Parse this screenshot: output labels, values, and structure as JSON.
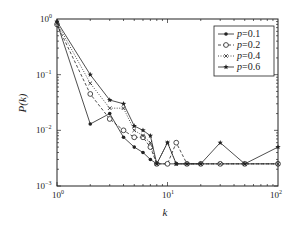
{
  "chart_data": {
    "type": "line",
    "title": "",
    "xlabel": "k",
    "ylabel": "P(k)",
    "xscale": "log",
    "yscale": "log",
    "xlim": [
      1,
      100
    ],
    "ylim": [
      0.001,
      1
    ],
    "xticks": [
      "10^0",
      "10^1",
      "10^2"
    ],
    "yticks": [
      "10^-3",
      "10^-2",
      "10^-1",
      "10^0"
    ],
    "grid": false,
    "legend_position": "upper right",
    "series": [
      {
        "name": "p=0.1",
        "marker": "dot",
        "line": "solid",
        "x": [
          1,
          2,
          3,
          4,
          5,
          6,
          7,
          8,
          10,
          12,
          15,
          20,
          30,
          50,
          100
        ],
        "y": [
          0.85,
          0.013,
          0.02,
          0.0075,
          0.005,
          0.004,
          0.003,
          0.0025,
          0.0025,
          0.0025,
          0.0025,
          0.0025,
          0.0025,
          0.0025,
          0.0025
        ]
      },
      {
        "name": "p=0.2",
        "marker": "circle",
        "line": "dashed",
        "x": [
          1,
          2,
          3,
          4,
          5,
          6,
          7,
          8,
          10,
          12,
          15,
          20,
          30,
          50,
          100
        ],
        "y": [
          0.8,
          0.045,
          0.016,
          0.01,
          0.0075,
          0.0075,
          0.005,
          0.0025,
          0.0025,
          0.006,
          0.0025,
          0.0025,
          0.0025,
          0.0025,
          0.0025
        ]
      },
      {
        "name": "p=0.4",
        "marker": "x",
        "line": "dotted",
        "x": [
          1,
          2,
          3,
          4,
          5,
          6,
          7,
          8,
          10,
          12,
          15,
          20,
          30,
          50,
          100
        ],
        "y": [
          0.85,
          0.07,
          0.025,
          0.025,
          0.01,
          0.008,
          0.006,
          0.0025,
          0.006,
          0.0025,
          0.0025,
          0.0025,
          0.0025,
          0.0025,
          0.0025
        ]
      },
      {
        "name": "p=0.6",
        "marker": "star",
        "line": "solid",
        "x": [
          1,
          2,
          3,
          4,
          5,
          6,
          7,
          8,
          10,
          12,
          15,
          20,
          30,
          50,
          100
        ],
        "y": [
          0.9,
          0.1,
          0.035,
          0.03,
          0.012,
          0.01,
          0.008,
          0.0025,
          0.006,
          0.0025,
          0.0025,
          0.0025,
          0.006,
          0.0025,
          0.005
        ]
      }
    ]
  },
  "axes": {
    "xlabel": "k",
    "ylabel": "P(k)",
    "xtick_labels": [
      {
        "base": "10",
        "exp": "0"
      },
      {
        "base": "10",
        "exp": "1"
      },
      {
        "base": "10",
        "exp": "2"
      }
    ],
    "ytick_labels": [
      {
        "base": "10",
        "exp": "0"
      },
      {
        "base": "10",
        "exp": "−1"
      },
      {
        "base": "10",
        "exp": "−2"
      },
      {
        "base": "10",
        "exp": "−3"
      }
    ]
  },
  "legend": {
    "items": [
      {
        "label": "p=0.1",
        "var": "p",
        "value": "=0.1"
      },
      {
        "label": "p=0.2",
        "var": "p",
        "value": "=0.2"
      },
      {
        "label": "p=0.4",
        "var": "p",
        "value": "=0.4"
      },
      {
        "label": "p=0.6",
        "var": "p",
        "value": "=0.6"
      }
    ]
  }
}
